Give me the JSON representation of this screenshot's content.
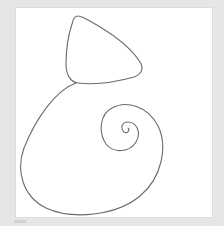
{
  "canvas": {
    "background_color": "#e6e6e6",
    "panel_color": "#ffffff",
    "stroke_color": "#6a6a6a"
  },
  "drawing": {
    "shapes": [
      {
        "name": "rounded-triangle",
        "description": "rounded triangular outline at top"
      },
      {
        "name": "spiral",
        "description": "large spiral curve below the triangle"
      }
    ]
  }
}
